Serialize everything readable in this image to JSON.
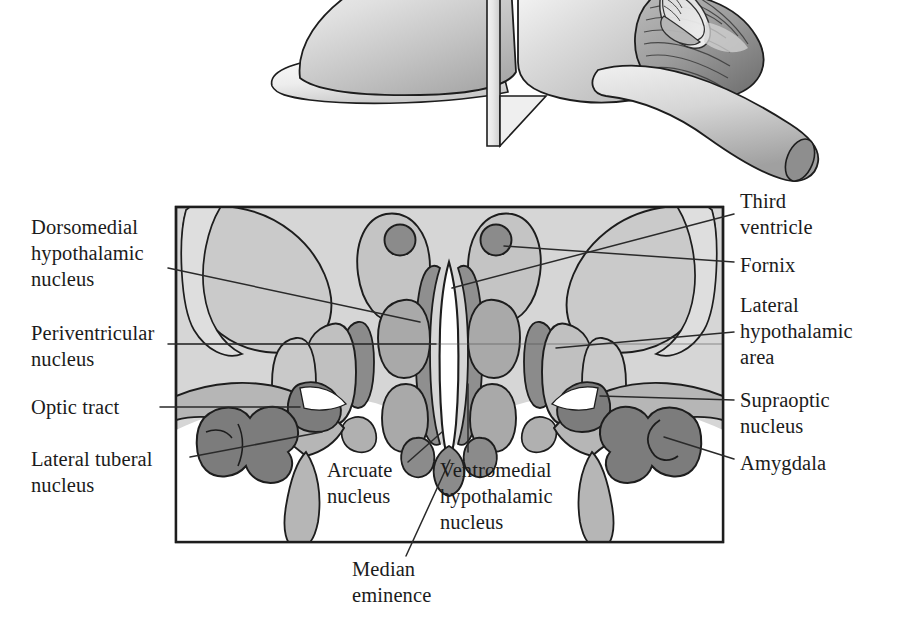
{
  "figure": {
    "title": "Hypothalamic nuclei in coronal section",
    "panels": {
      "top": {
        "name": "brain-sagittal-with-section-plane",
        "description": "Lateral view of brain with cut plane through hypothalamus",
        "inset_description": "Small coronal orientation inset"
      },
      "bottom": {
        "name": "coronal-section-of-hypothalamus"
      }
    }
  },
  "labels": {
    "dorsomedial": "Dorsomedial\nhypothalamic\nnucleus",
    "periventricular": "Periventricular\nnucleus",
    "optic_tract": "Optic tract",
    "lateral_tuberal": "Lateral tuberal\nnucleus",
    "third_ventricle": "Third\nventricle",
    "fornix": "Fornix",
    "lateral_hypothalamic": "Lateral\nhypothalamic\narea",
    "supraoptic": "Supraoptic\nnucleus",
    "amygdala": "Amygdala",
    "arcuate": "Arcuate\nnucleus",
    "ventromedial": "Ventromedial\nhypothalamic\nnucleus",
    "median_eminence": "Median\neminence"
  },
  "colors": {
    "background": "#ffffff",
    "section_field": "#d6d6d6",
    "tissue_light": "#cfcfcf",
    "tissue_mid": "#b0b0b0",
    "tissue_dark": "#8d8d8d",
    "tissue_darker": "#7c7c7c",
    "ventricle_white": "#ffffff",
    "outline": "#1d1d1d",
    "leader_line": "#2a2a2a",
    "text": "#1b1b1b",
    "brain_light": "#e4e4e4",
    "brain_mid": "#c4c4c4",
    "brain_shadow": "#9a9a9a"
  },
  "geometry": {
    "frame": {
      "x": 176,
      "y": 207,
      "width": 547,
      "height": 335
    }
  }
}
